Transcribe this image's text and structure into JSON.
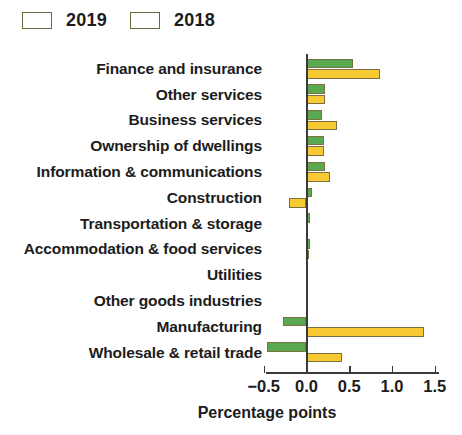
{
  "legend": {
    "position": "top-left",
    "entries": [
      {
        "label": "2019",
        "color": "#5aa84f",
        "icon": "legend-swatch-green"
      },
      {
        "label": "2018",
        "color": "#f7c933",
        "icon": "legend-swatch-yellow"
      }
    ]
  },
  "axis": {
    "xlabel": "Percentage points",
    "ticks": [
      {
        "value": -0.5,
        "label": "−0.5"
      },
      {
        "value": 0.0,
        "label": "0.0"
      },
      {
        "value": 0.5,
        "label": "0.5"
      },
      {
        "value": 1.0,
        "label": "1.0"
      },
      {
        "value": 1.5,
        "label": "1.5"
      }
    ],
    "xlim": [
      -0.5,
      1.5
    ]
  },
  "chart_data": {
    "type": "bar",
    "orientation": "horizontal",
    "title": "",
    "subtitle": "",
    "xlabel": "Percentage points",
    "ylabel": "",
    "xlim": [
      -0.5,
      1.5
    ],
    "xticks": [
      -0.5,
      0.0,
      0.5,
      1.0,
      1.5
    ],
    "grid": false,
    "legend": [
      "2019",
      "2018"
    ],
    "legend_position": "top-left",
    "colors": {
      "2019": "#5aa84f",
      "2018": "#f7c933"
    },
    "categories": [
      "Finance and insurance",
      "Other services",
      "Business services",
      "Ownership of dwellings",
      "Information & communications",
      "Construction",
      "Transportation & storage",
      "Accommodation & food services",
      "Utilities",
      "Other goods industries",
      "Manufacturing",
      "Wholesale & retail trade"
    ],
    "series": [
      {
        "name": "2019",
        "color": "#5aa84f",
        "values": [
          0.54,
          0.22,
          0.18,
          0.2,
          0.22,
          0.06,
          0.04,
          0.04,
          0.0,
          0.0,
          -0.28,
          -0.46
        ]
      },
      {
        "name": "2018",
        "color": "#f7c933",
        "values": [
          0.86,
          0.22,
          0.36,
          0.2,
          0.28,
          -0.21,
          0.0,
          0.03,
          0.0,
          0.0,
          1.38,
          0.41
        ]
      }
    ]
  }
}
